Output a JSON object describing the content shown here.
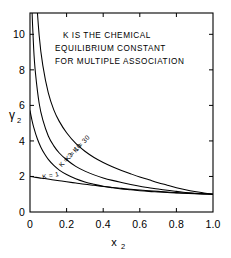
{
  "chart_data": {
    "type": "line",
    "title": "",
    "annotation_lines": [
      "K IS THE CHEMICAL",
      "EQUILIBRIUM CONSTANT",
      "FOR MULTIPLE ASSOCIATION"
    ],
    "xlabel": "x",
    "xlabel_sub": "2",
    "ylabel": "γ",
    "ylabel_sub": "2",
    "xlim": [
      0,
      1.0
    ],
    "ylim": [
      0,
      11.2
    ],
    "xticks": [
      0,
      0.2,
      0.4,
      0.6,
      0.8,
      1.0
    ],
    "xtick_labels": [
      "0",
      "0.2",
      "0.4",
      "0.6",
      "0.8",
      "1.0"
    ],
    "yticks": [
      0,
      2,
      4,
      6,
      8,
      10
    ],
    "ytick_labels": [
      "0",
      "2",
      "4",
      "6",
      "8",
      "10"
    ],
    "grid": false,
    "legend": "inline-curve-labels",
    "tick_direction": "in",
    "frame": "box",
    "series": [
      {
        "name": "K = 1",
        "label": "K = 1",
        "label_x": 0.115,
        "label_y": 1.93,
        "label_rotation": -11,
        "x": [
          0.0,
          0.02,
          0.05,
          0.08,
          0.12,
          0.16,
          0.2,
          0.25,
          0.3,
          0.35,
          0.4,
          0.45,
          0.5,
          0.55,
          0.6,
          0.65,
          0.7,
          0.75,
          0.8,
          0.85,
          0.9,
          0.95,
          1.0
        ],
        "values": [
          2.0,
          1.97,
          1.92,
          1.88,
          1.82,
          1.76,
          1.7,
          1.63,
          1.56,
          1.5,
          1.44,
          1.38,
          1.33,
          1.28,
          1.24,
          1.2,
          1.16,
          1.12,
          1.09,
          1.06,
          1.04,
          1.02,
          1.0
        ]
      },
      {
        "name": "K = 3",
        "label": "K = 3",
        "label_x": 0.205,
        "label_y": 2.85,
        "label_rotation": -47,
        "x": [
          0.0,
          0.01,
          0.02,
          0.04,
          0.06,
          0.08,
          0.1,
          0.13,
          0.16,
          0.2,
          0.25,
          0.3,
          0.35,
          0.4,
          0.45,
          0.5,
          0.55,
          0.6,
          0.65,
          0.7,
          0.75,
          0.8,
          0.85,
          0.9,
          0.95,
          1.0
        ],
        "values": [
          5.7,
          5.2,
          4.78,
          4.12,
          3.63,
          3.26,
          2.96,
          2.62,
          2.36,
          2.11,
          1.87,
          1.69,
          1.56,
          1.45,
          1.37,
          1.3,
          1.25,
          1.2,
          1.16,
          1.13,
          1.1,
          1.07,
          1.05,
          1.03,
          1.015,
          1.0
        ]
      },
      {
        "name": "K = 10",
        "label": "K = 10",
        "label_x": 0.245,
        "label_y": 3.28,
        "label_rotation": -47,
        "x": [
          0.0,
          0.005,
          0.01,
          0.02,
          0.03,
          0.05,
          0.07,
          0.1,
          0.13,
          0.16,
          0.2,
          0.25,
          0.3,
          0.35,
          0.4,
          0.45,
          0.5,
          0.55,
          0.6,
          0.65,
          0.7,
          0.75,
          0.8,
          0.85,
          0.9,
          0.95,
          1.0
        ],
        "values": [
          17.0,
          13.6,
          11.6,
          9.2,
          7.8,
          6.12,
          5.18,
          4.28,
          3.72,
          3.32,
          2.94,
          2.57,
          2.3,
          2.09,
          1.92,
          1.78,
          1.66,
          1.55,
          1.45,
          1.37,
          1.29,
          1.22,
          1.16,
          1.1,
          1.06,
          1.03,
          1.0
        ]
      },
      {
        "name": "K = 30",
        "label": "K = 30",
        "label_x": 0.29,
        "label_y": 3.75,
        "label_rotation": -47,
        "x": [
          0.0,
          0.005,
          0.01,
          0.02,
          0.03,
          0.05,
          0.07,
          0.1,
          0.13,
          0.16,
          0.2,
          0.25,
          0.3,
          0.35,
          0.4,
          0.45,
          0.5,
          0.55,
          0.6,
          0.65,
          0.7,
          0.75,
          0.8,
          0.85,
          0.9,
          0.95,
          1.0
        ],
        "values": [
          30.0,
          24.0,
          20.2,
          15.6,
          13.0,
          9.95,
          8.25,
          6.7,
          5.75,
          5.1,
          4.46,
          3.86,
          3.42,
          3.07,
          2.79,
          2.55,
          2.34,
          2.15,
          1.97,
          1.81,
          1.65,
          1.51,
          1.37,
          1.25,
          1.15,
          1.07,
          1.0
        ]
      }
    ]
  },
  "colors": {
    "ink": "#000000",
    "background": "#ffffff"
  }
}
